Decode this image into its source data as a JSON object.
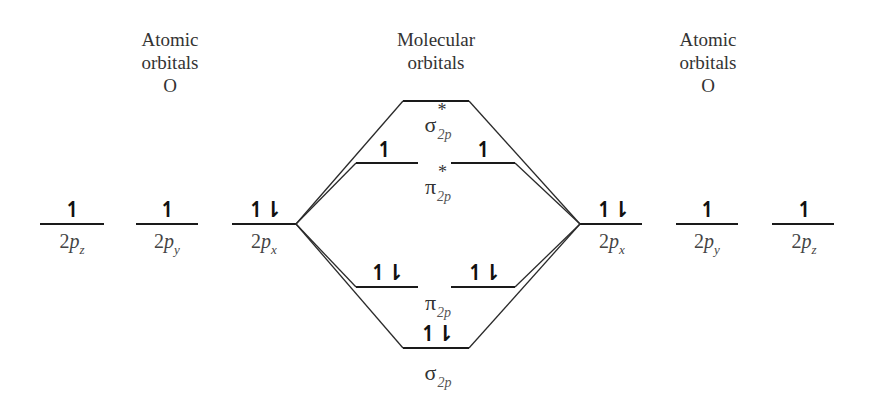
{
  "headings": {
    "left": {
      "line1": "Atomic",
      "line2": "orbitals",
      "line3": "O"
    },
    "center": {
      "line1": "Molecular",
      "line2": "orbitals"
    },
    "right": {
      "line1": "Atomic",
      "line2": "orbitals",
      "line3": "O"
    }
  },
  "left_atom": [
    {
      "label_base": "2",
      "label_p": "p",
      "label_sub": "z",
      "electrons": "↿"
    },
    {
      "label_base": "2",
      "label_p": "p",
      "label_sub": "y",
      "electrons": "↿"
    },
    {
      "label_base": "2",
      "label_p": "p",
      "label_sub": "x",
      "electrons": "↿⇂"
    }
  ],
  "right_atom": [
    {
      "label_base": "2",
      "label_p": "p",
      "label_sub": "x",
      "electrons": "↿⇂"
    },
    {
      "label_base": "2",
      "label_p": "p",
      "label_sub": "y",
      "electrons": "↿"
    },
    {
      "label_base": "2",
      "label_p": "p",
      "label_sub": "z",
      "electrons": "↿"
    }
  ],
  "molecular_orbitals": {
    "sigma_star": {
      "symbol": "σ",
      "sup": "*",
      "sub": "2p",
      "electrons": ""
    },
    "pi_star": {
      "symbol": "π",
      "sup": "*",
      "sub": "2p",
      "electrons_left": "↿",
      "electrons_right": "↿"
    },
    "pi": {
      "symbol": "π",
      "sub": "2p",
      "electrons_left": "↿⇂",
      "electrons_right": "↿⇂"
    },
    "sigma": {
      "symbol": "σ",
      "sub": "2p",
      "electrons": "↿⇂"
    }
  }
}
